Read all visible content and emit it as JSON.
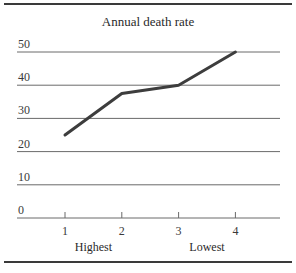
{
  "chart_data": {
    "type": "line",
    "title": "Annual death rate",
    "xlabel": "",
    "ylabel": "",
    "categories": [
      "1",
      "2",
      "3",
      "4"
    ],
    "x": [
      1,
      2,
      3,
      4
    ],
    "series": [
      {
        "name": "Annual death rate",
        "values": [
          25,
          37.5,
          40,
          50
        ]
      }
    ],
    "y_ticks": [
      0,
      10,
      20,
      30,
      40,
      50
    ],
    "ylim": [
      0,
      50
    ],
    "x_annotations": [
      {
        "label": "Highest",
        "position": 1.5
      },
      {
        "label": "Lowest",
        "position": 3.5
      }
    ],
    "grid": true,
    "legend": "none",
    "line_color": "#3d3d3d",
    "grid_color": "#6a6a6a"
  }
}
